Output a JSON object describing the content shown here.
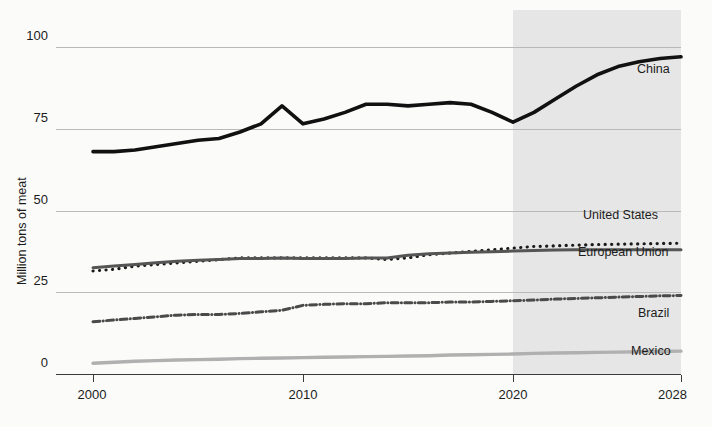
{
  "chart_data": {
    "type": "line",
    "title": "",
    "subtitle": "",
    "xlabel": "",
    "ylabel": "Million tons of meat",
    "xlim": [
      2000,
      2028
    ],
    "ylim": [
      0,
      100
    ],
    "grid": true,
    "legend_position": "right-inline-labels",
    "x_ticks": [
      "2000",
      "2010",
      "2020",
      "2028"
    ],
    "x_tick_values": [
      2000,
      2010,
      2020,
      2028
    ],
    "y_ticks": [
      "0",
      "25",
      "50",
      "75",
      "100"
    ],
    "y_tick_values": [
      0,
      25,
      50,
      75,
      100
    ],
    "annotations": [
      {
        "name": "forecast-shading",
        "label": "",
        "x_start": 2020,
        "x_end": 2028,
        "color": "#e2e2e2"
      }
    ],
    "x": [
      2000,
      2001,
      2002,
      2003,
      2004,
      2005,
      2006,
      2007,
      2008,
      2009,
      2010,
      2011,
      2012,
      2013,
      2014,
      2015,
      2016,
      2017,
      2018,
      2019,
      2020,
      2021,
      2022,
      2023,
      2024,
      2025,
      2026,
      2027,
      2028
    ],
    "series": [
      {
        "name": "China",
        "color": "#111111",
        "style": "solid",
        "width": 3.6,
        "label": "China",
        "values": [
          68,
          68,
          68.5,
          69.5,
          70.5,
          71.5,
          72,
          74,
          76.5,
          82,
          76.5,
          78,
          80,
          82.5,
          82.5,
          82,
          82.5,
          83,
          82.5,
          80,
          77,
          80,
          84,
          88,
          91.5,
          94,
          95.5,
          96.5,
          97
        ]
      },
      {
        "name": "United States",
        "color": "#1a1a1a",
        "style": "dotted",
        "width": 3.2,
        "label": "United States",
        "values": [
          31.5,
          32,
          33,
          33.5,
          34,
          34.5,
          35,
          35.5,
          35.5,
          35.5,
          35.5,
          35.5,
          35.5,
          35.5,
          35,
          35.5,
          36.5,
          37,
          37.5,
          38,
          38.5,
          39,
          39.2,
          39.4,
          39.6,
          39.7,
          39.8,
          39.9,
          40
        ]
      },
      {
        "name": "European Union",
        "color": "#555555",
        "style": "solid",
        "width": 3.0,
        "label": "European Union",
        "values": [
          32.5,
          33,
          33.5,
          34,
          34.5,
          34.8,
          35,
          35.3,
          35.3,
          35.5,
          35.3,
          35.3,
          35.3,
          35.5,
          35.5,
          36.3,
          36.8,
          37,
          37.2,
          37.4,
          37.6,
          37.8,
          37.9,
          38,
          38,
          38,
          38,
          38,
          38
        ]
      },
      {
        "name": "Brazil",
        "color": "#4a4a4a",
        "style": "dashdot",
        "width": 3.0,
        "label": "Brazil",
        "values": [
          16,
          16.5,
          17,
          17.5,
          18,
          18.2,
          18.2,
          18.5,
          19,
          19.5,
          21,
          21.3,
          21.5,
          21.5,
          21.8,
          21.8,
          21.8,
          22,
          22,
          22.2,
          22.4,
          22.6,
          22.9,
          23.1,
          23.3,
          23.5,
          23.7,
          23.9,
          24
        ]
      },
      {
        "name": "Mexico",
        "color": "#b0b0b0",
        "style": "solid",
        "width": 3.4,
        "label": "Mexico",
        "values": [
          3.3,
          3.6,
          3.9,
          4.1,
          4.3,
          4.4,
          4.5,
          4.7,
          4.8,
          4.9,
          5.0,
          5.1,
          5.2,
          5.3,
          5.4,
          5.5,
          5.6,
          5.8,
          5.9,
          6.0,
          6.1,
          6.3,
          6.4,
          6.5,
          6.6,
          6.7,
          6.8,
          6.9,
          7.0
        ]
      }
    ]
  },
  "colors": {
    "background": "#fbfbfa",
    "gridline": "#b9b9b9",
    "axis": "#3a3a3a",
    "text": "#1b1b1b",
    "forecast_band": "#e2e2e2"
  }
}
